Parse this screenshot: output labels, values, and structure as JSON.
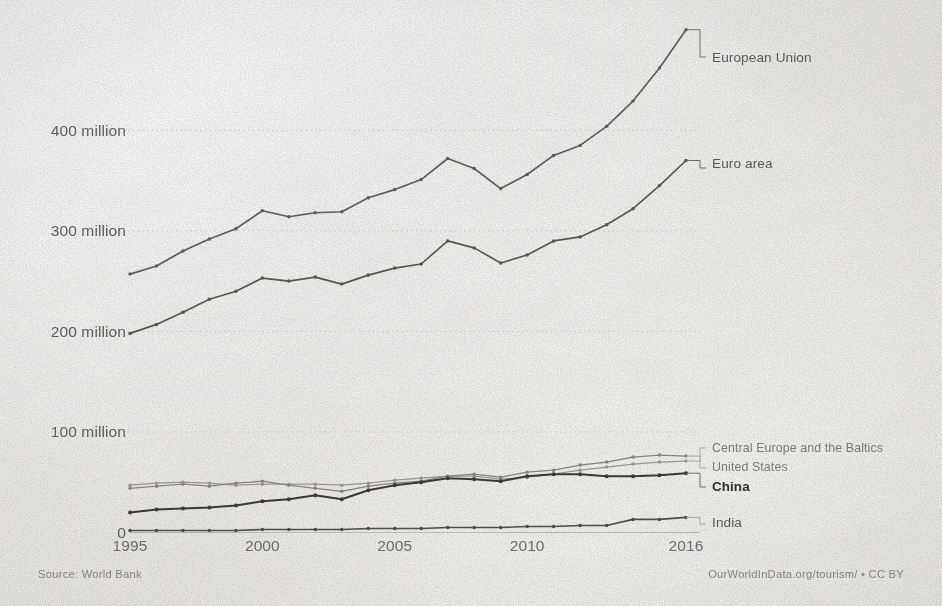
{
  "chart_data": {
    "type": "line",
    "title": "",
    "subtitle": "",
    "xlabel": "",
    "ylabel": "",
    "x": [
      1995,
      1996,
      1997,
      1998,
      1999,
      2000,
      2001,
      2002,
      2003,
      2004,
      2005,
      2006,
      2007,
      2008,
      2009,
      2010,
      2011,
      2012,
      2013,
      2014,
      2015,
      2016
    ],
    "xlim": [
      1995,
      2016
    ],
    "ylim": [
      0,
      500
    ],
    "y_unit": "million",
    "grid": true,
    "legend_position": "right-inline-labels",
    "xticks": [
      "1995",
      "2000",
      "2005",
      "2010",
      "2016"
    ],
    "xtick_values": [
      1995,
      2000,
      2005,
      2010,
      2016
    ],
    "yticks": [
      "0",
      "100 million",
      "200 million",
      "300 million",
      "400 million"
    ],
    "ytick_values": [
      0,
      100,
      200,
      300,
      400
    ],
    "series": [
      {
        "name": "European Union",
        "label": "European Union",
        "color": "#5c5b59",
        "emphasis": "normal",
        "values": [
          257,
          265,
          280,
          292,
          302,
          320,
          314,
          318,
          319,
          333,
          341,
          351,
          372,
          362,
          342,
          356,
          375,
          385,
          404,
          429,
          462,
          500
        ]
      },
      {
        "name": "Euro area",
        "label": "Euro area",
        "color": "#56554f",
        "emphasis": "normal",
        "values": [
          198,
          207,
          219,
          232,
          240,
          253,
          250,
          254,
          247,
          256,
          263,
          267,
          290,
          283,
          268,
          276,
          290,
          294,
          306,
          322,
          345,
          370
        ]
      },
      {
        "name": "Central Europe and the Baltics",
        "label": "Central Europe and the Baltics",
        "color": "#97948f",
        "emphasis": "light",
        "values": [
          47,
          49,
          50,
          49,
          47,
          48,
          48,
          48,
          47,
          49,
          52,
          54,
          56,
          56,
          53,
          55,
          58,
          62,
          65,
          68,
          70,
          71
        ]
      },
      {
        "name": "United States",
        "label": "United States",
        "color": "#85827d",
        "emphasis": "light",
        "values": [
          44,
          46,
          48,
          46,
          49,
          51,
          47,
          44,
          41,
          46,
          49,
          51,
          56,
          58,
          55,
          60,
          62,
          67,
          70,
          75,
          77,
          76
        ]
      },
      {
        "name": "China",
        "label": "China",
        "color": "#3a3937",
        "emphasis": "bold",
        "values": [
          20,
          23,
          24,
          25,
          27,
          31,
          33,
          37,
          33,
          42,
          47,
          50,
          54,
          53,
          51,
          56,
          58,
          58,
          56,
          56,
          57,
          59
        ]
      },
      {
        "name": "India",
        "label": "India",
        "color": "#4c4b49",
        "emphasis": "normal",
        "values": [
          2,
          2,
          2,
          2,
          2,
          3,
          3,
          3,
          3,
          4,
          4,
          4,
          5,
          5,
          5,
          6,
          6,
          7,
          7,
          13,
          13,
          15
        ]
      }
    ],
    "source": "Source: World Bank",
    "attribution": "OurWorldInData.org/tourism/ • CC BY"
  },
  "footer": {
    "source": "Source: World Bank",
    "attribution": "OurWorldInData.org/tourism/ • CC BY"
  }
}
